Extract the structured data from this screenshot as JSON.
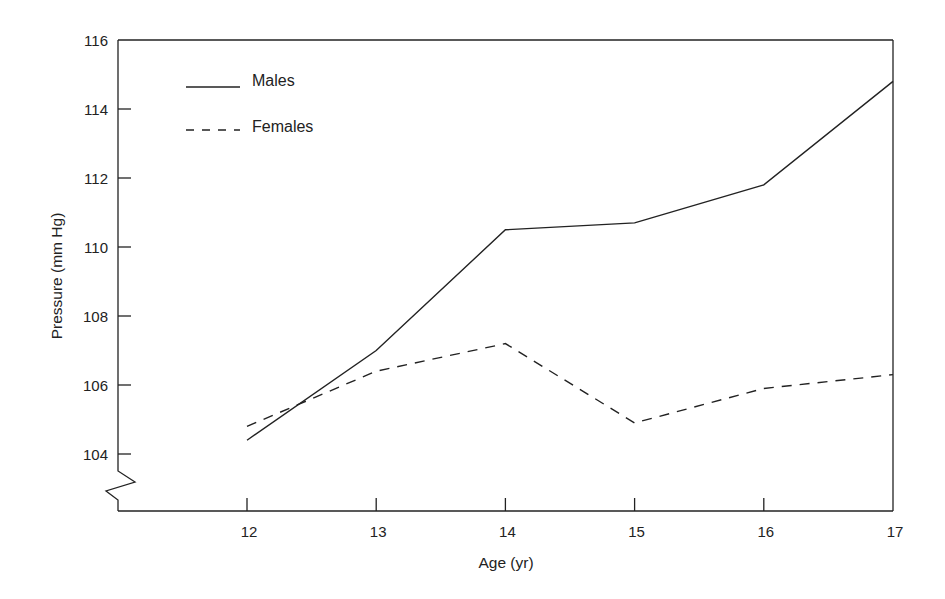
{
  "chart_data": {
    "type": "line",
    "title": "",
    "xlabel": "Age (yr)",
    "ylabel": "Pressure (mm Hg)",
    "x": [
      12,
      13,
      14,
      15,
      16,
      17
    ],
    "x_tick_labels": [
      "12",
      "13",
      "14",
      "15",
      "16",
      "17"
    ],
    "y_tick_labels": [
      "116",
      "114",
      "112",
      "110",
      "108",
      "106",
      "104"
    ],
    "ylim": [
      102.3,
      116
    ],
    "xlim": [
      11,
      17
    ],
    "grid": false,
    "axis_break": "y-axis zigzag below 104",
    "legend_position": "upper-left",
    "series": [
      {
        "name": "Males",
        "style": "solid",
        "values": [
          104.4,
          107.0,
          110.5,
          110.7,
          111.8,
          114.8
        ]
      },
      {
        "name": "Females",
        "style": "dashed",
        "values": [
          104.8,
          106.4,
          107.2,
          104.9,
          105.9,
          106.3
        ]
      }
    ]
  },
  "legend": {
    "males": "Males",
    "females": "Females"
  },
  "colors": {
    "line": "#222222",
    "background": "#ffffff"
  }
}
